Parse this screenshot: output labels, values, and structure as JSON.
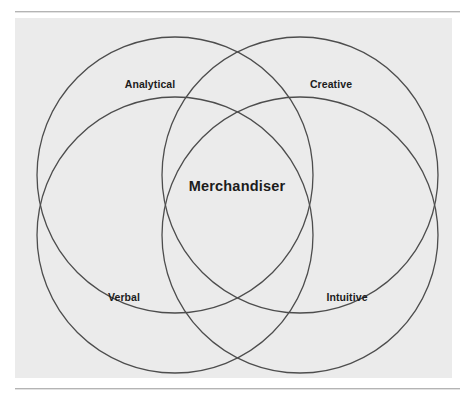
{
  "figure": {
    "name": "merchandiser-skills-venn-diagram",
    "type": "venn",
    "background_color": "#ffffff",
    "panel_color": "#ebebeb",
    "stroke_color": "#4d4d4d",
    "text_color": "#1c1c1c",
    "center_label": "Merchandiser",
    "sets": [
      {
        "id": "analytical",
        "label": "Analytical",
        "position": "top-left",
        "cx": 175,
        "cy": 175,
        "r": 138,
        "label_x": 150,
        "label_y": 84
      },
      {
        "id": "creative",
        "label": "Creative",
        "position": "top-right",
        "cx": 300,
        "cy": 175,
        "r": 138,
        "label_x": 331,
        "label_y": 84
      },
      {
        "id": "verbal",
        "label": "Verbal",
        "position": "bottom-left",
        "cx": 175,
        "cy": 235,
        "r": 138,
        "label_x": 124,
        "label_y": 297
      },
      {
        "id": "intuitive",
        "label": "Intuitive",
        "position": "bottom-right",
        "cx": 300,
        "cy": 235,
        "r": 138,
        "label_x": 347,
        "label_y": 297
      }
    ],
    "center": {
      "x": 237,
      "y": 186
    }
  }
}
